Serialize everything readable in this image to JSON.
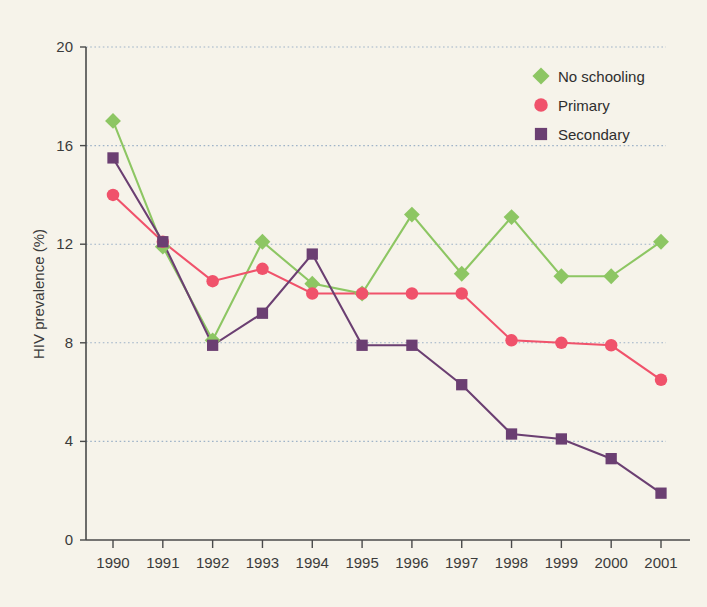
{
  "figure": {
    "background_color": "#f6f3ea",
    "axis_color": "#4a4a4a",
    "grid_color": "#9fb3c8"
  },
  "axes": {
    "y_title": "HIV prevalence (%)",
    "y_ticks": [
      "0",
      "4",
      "8",
      "12",
      "16",
      "20"
    ],
    "x_ticks": [
      "1990",
      "1991",
      "1992",
      "1993",
      "1994",
      "1995",
      "1996",
      "1997",
      "1998",
      "1999",
      "2000",
      "2001"
    ]
  },
  "legend": {
    "items": [
      {
        "label": "No schooling",
        "color": "#8dc663",
        "marker": "diamond"
      },
      {
        "label": "Primary",
        "color": "#f0526b",
        "marker": "circle"
      },
      {
        "label": "Secondary",
        "color": "#6b3f72",
        "marker": "square"
      }
    ]
  },
  "chart_data": {
    "type": "line",
    "title": "",
    "xlabel": "",
    "ylabel": "HIV prevalence (%)",
    "xlim": [
      1990,
      2001
    ],
    "ylim": [
      0,
      20
    ],
    "yticks": [
      0,
      4,
      8,
      12,
      16,
      20
    ],
    "grid": true,
    "grid_axis": "y",
    "legend_position": "top-right",
    "categories": [
      1990,
      1991,
      1992,
      1993,
      1994,
      1995,
      1996,
      1997,
      1998,
      1999,
      2000,
      2001
    ],
    "series": [
      {
        "name": "No schooling",
        "color": "#8dc663",
        "marker": "diamond",
        "values": [
          17.0,
          11.9,
          8.1,
          12.1,
          10.4,
          10.0,
          13.2,
          10.8,
          13.1,
          10.7,
          10.7,
          12.1
        ]
      },
      {
        "name": "Primary",
        "color": "#f0526b",
        "marker": "circle",
        "values": [
          14.0,
          12.1,
          10.5,
          11.0,
          10.0,
          10.0,
          10.0,
          10.0,
          8.1,
          8.0,
          7.9,
          6.5
        ]
      },
      {
        "name": "Secondary",
        "color": "#6b3f72",
        "marker": "square",
        "values": [
          15.5,
          12.1,
          7.9,
          9.2,
          11.6,
          7.9,
          7.9,
          6.3,
          4.3,
          4.1,
          3.3,
          1.9
        ]
      }
    ]
  }
}
